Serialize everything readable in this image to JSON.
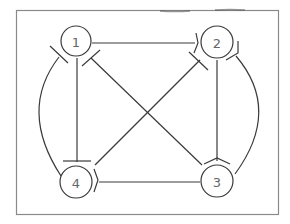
{
  "diagram": {
    "type": "graph",
    "colors": {
      "stroke": "#3a3a3a",
      "frame": "#8a8a8a",
      "label": "#666666",
      "background": "#ffffff"
    },
    "nodes": [
      {
        "id": "1",
        "label": "1",
        "x": 76,
        "y": 41
      },
      {
        "id": "2",
        "label": "2",
        "x": 217,
        "y": 42
      },
      {
        "id": "3",
        "label": "3",
        "x": 217,
        "y": 181
      },
      {
        "id": "4",
        "label": "4",
        "x": 76,
        "y": 182
      }
    ],
    "edges": [
      {
        "from": "1",
        "to": "2",
        "shape": "straight"
      },
      {
        "from": "1",
        "to": "4",
        "shape": "straight"
      },
      {
        "from": "1",
        "to": "3",
        "shape": "straight"
      },
      {
        "from": "2",
        "to": "4",
        "shape": "straight"
      },
      {
        "from": "2",
        "to": "3",
        "shape": "straight"
      },
      {
        "from": "4",
        "to": "3",
        "shape": "straight"
      },
      {
        "from": "1",
        "to": "4",
        "shape": "arc-left"
      },
      {
        "from": "2",
        "to": "3",
        "shape": "arc-right"
      }
    ]
  }
}
